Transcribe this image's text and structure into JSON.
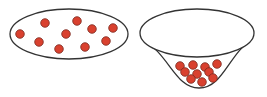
{
  "diagram": {
    "colors": {
      "stroke": "#333333",
      "dot_fill": "#d9412f",
      "dot_stroke": "#7a2a20",
      "background": "#ffffff"
    },
    "left_container": {
      "shape": "ellipse",
      "dots": [
        [
          20,
          34
        ],
        [
          45,
          23
        ],
        [
          77,
          21
        ],
        [
          92,
          29
        ],
        [
          113,
          28
        ],
        [
          66,
          34
        ],
        [
          39,
          42
        ],
        [
          59,
          49
        ],
        [
          85,
          47
        ],
        [
          106,
          41
        ]
      ]
    },
    "right_container": {
      "shape": "funnel",
      "dots": [
        [
          180,
          66
        ],
        [
          193,
          65
        ],
        [
          205,
          67
        ],
        [
          217,
          64
        ],
        [
          185,
          72
        ],
        [
          197,
          74
        ],
        [
          209,
          72
        ],
        [
          191,
          79
        ],
        [
          202,
          82
        ],
        [
          213,
          78
        ]
      ]
    }
  }
}
